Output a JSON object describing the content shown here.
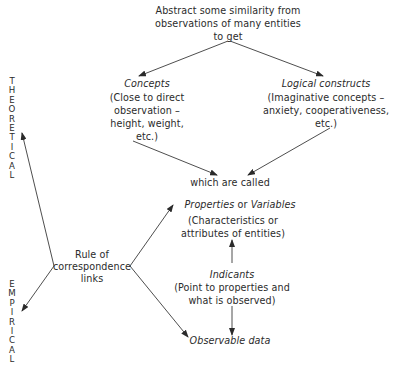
{
  "diagram": {
    "top": {
      "line1": "Abstract some similarity from",
      "line2": "observations of many entities",
      "line3": "to get"
    },
    "concepts": {
      "title": "Concepts",
      "line1": "(Close to direct",
      "line2": "observation –",
      "line3": "height, weight,",
      "line4": "etc.)"
    },
    "logical_constructs": {
      "title": "Logical constructs",
      "line1": "(Imaginative concepts –",
      "line2": "anxiety, cooperativeness,",
      "line3": "etc.)"
    },
    "which_are_called": "which are called",
    "properties": {
      "title_italic_1": "Properties",
      "connector": "or",
      "title_italic_2": "Variables",
      "line1": "(Characteristics or",
      "line2": "attributes of entities)"
    },
    "indicants": {
      "title": "Indicants",
      "line1": "(Point to properties and",
      "line2": "what is observed)"
    },
    "observable_data": "Observable data",
    "rule_of_correspondence": {
      "line1": "Rule of",
      "line2": "correspondence",
      "line3": "links"
    },
    "side_labels": {
      "theoretical": [
        "T",
        "H",
        "E",
        "O",
        "R",
        "E",
        "T",
        "I",
        "C",
        "A",
        "L"
      ],
      "empirical": [
        "E",
        "M",
        "P",
        "I",
        "R",
        "I",
        "C",
        "A",
        "L"
      ]
    }
  }
}
